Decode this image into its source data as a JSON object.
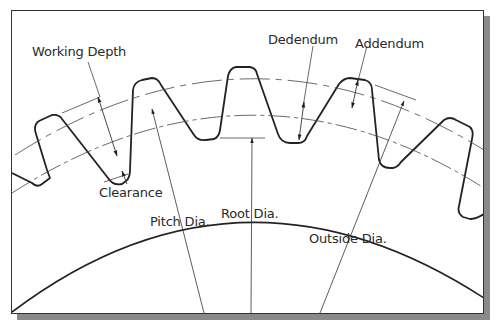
{
  "figure": {
    "labels": {
      "working_depth": "Working Depth",
      "dedendum": "Dedendum",
      "addendum": "Addendum",
      "clearance": "Clearance",
      "pitch_dia": "Pitch Dia.",
      "root_dia": "Root Dia.",
      "outside_dia": "Outside Dia."
    },
    "colors": {
      "line": "#222222",
      "thin_line": "#444444",
      "frame_shadow": "#8a8a8a",
      "background": "#ffffff"
    }
  }
}
